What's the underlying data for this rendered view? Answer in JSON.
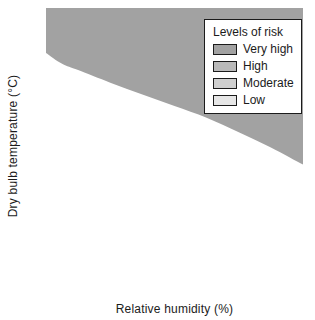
{
  "legend": {
    "title": "Levels of risk",
    "items": [
      {
        "label": "Very high",
        "color": "#a2a2a2"
      },
      {
        "label": "High",
        "color": "#b9b9b9"
      },
      {
        "label": "Moderate",
        "color": "#cfcfcf"
      },
      {
        "label": "Low",
        "color": "#e6e6e6"
      }
    ]
  },
  "chart_data": {
    "type": "area",
    "title": "",
    "xlabel": "Relative humidity (%)",
    "ylabel": "Dry bulb temperature (°C)",
    "x": [
      20,
      25,
      30,
      40,
      50,
      60,
      70,
      80,
      90,
      100
    ],
    "series": [
      {
        "name": "High / Very high boundary",
        "values": [
          40.0,
          38.8,
          38.1,
          36.7,
          35.4,
          34.1,
          32.8,
          31.2,
          29.5,
          27.6
        ]
      },
      {
        "name": "Moderate / High boundary",
        "values": [
          34.0,
          32.7,
          31.8,
          30.4,
          29.2,
          28.0,
          26.7,
          25.4,
          24.0,
          22.6
        ]
      },
      {
        "name": "Low / Moderate boundary",
        "values": [
          27.5,
          26.6,
          25.9,
          24.6,
          23.4,
          22.2,
          20.9,
          19.3,
          16.3,
          13.2
        ]
      }
    ],
    "zones": [
      {
        "label": "Very high",
        "color": "#a2a2a2"
      },
      {
        "label": "High",
        "color": "#b9b9b9"
      },
      {
        "label": "Moderate",
        "color": "#cfcfcf"
      },
      {
        "label": "Low",
        "color": "#e6e6e6"
      }
    ],
    "x_ticks": [
      20,
      40,
      60,
      80,
      100
    ],
    "y_ticks": [
      45,
      40,
      35,
      30,
      25,
      20,
      0
    ],
    "xlim": [
      20,
      100
    ],
    "ylim": [
      0,
      45
    ],
    "axis_break": "y axis compressed between 0 and 20",
    "grid": false,
    "legend_position": "top-right",
    "line_color": "#1b1b1b"
  }
}
